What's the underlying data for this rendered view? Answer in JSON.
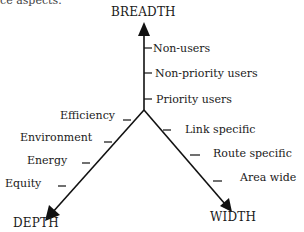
{
  "partial_text": "ce aspects.",
  "axes": {
    "breadth": {
      "label": "BREADTH",
      "ticks": [
        "Non-users",
        "Non-priority users",
        "Priority users"
      ]
    },
    "depth": {
      "label": "DEPTH",
      "ticks": [
        "Efficiency",
        "Environment",
        "Energy",
        "Equity"
      ]
    },
    "width": {
      "label": "WIDTH",
      "ticks": [
        "Link specific",
        "Route specific",
        "Area wide"
      ]
    }
  }
}
